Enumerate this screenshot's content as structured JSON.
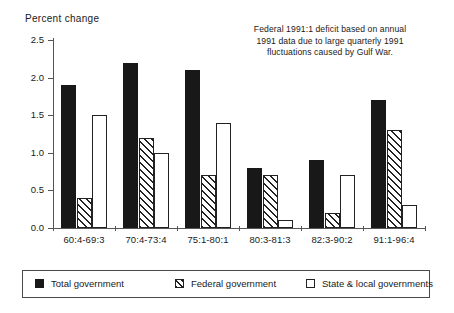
{
  "chart_data": {
    "type": "bar",
    "title": "",
    "ylabel": "Percent change",
    "xlabel": "",
    "ylim": [
      0.0,
      2.5
    ],
    "yticks": [
      "0.0",
      "0.5",
      "1.0",
      "1.5",
      "2.0",
      "2.5"
    ],
    "ytick_values": [
      0.0,
      0.5,
      1.0,
      1.5,
      2.0,
      2.5
    ],
    "grid": false,
    "legend_position": "bottom",
    "categories": [
      "60:4-69:3",
      "70:4-73:4",
      "75:1-80:1",
      "80:3-81:3",
      "82:3-90:2",
      "91:1-96:4"
    ],
    "series": [
      {
        "name": "Total government",
        "values": [
          1.9,
          2.2,
          2.1,
          0.8,
          0.9,
          1.7
        ]
      },
      {
        "name": "Federal government",
        "values": [
          0.4,
          1.2,
          0.7,
          0.7,
          0.2,
          1.3
        ]
      },
      {
        "name": "State & local governments",
        "values": [
          1.5,
          1.0,
          1.4,
          0.1,
          0.7,
          0.3
        ]
      }
    ],
    "annotations": [
      "Federal 1991:1 deficit based on annual",
      "1991 data due to large quarterly 1991",
      "fluctuations caused by Gulf War."
    ]
  },
  "legend": {
    "items": [
      {
        "label": "Total government",
        "style": "solid-black"
      },
      {
        "label": "Federal government",
        "style": "diagonal-hatch"
      },
      {
        "label": "State & local governments",
        "style": "white-outline"
      }
    ]
  },
  "colors": {
    "total": "#181818",
    "federal_outline": "#222222",
    "state_outline": "#222222",
    "axis": "#555555",
    "background": "#ffffff"
  }
}
